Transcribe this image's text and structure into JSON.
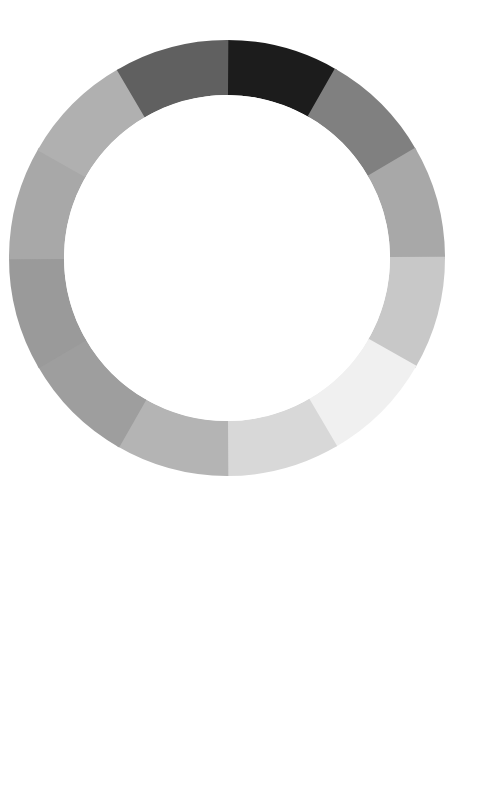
{
  "figure": {
    "background_color": "#ffffff",
    "hole_color": "#ffffff",
    "caption": ""
  },
  "chart_data": {
    "type": "pie",
    "subtitle": "",
    "xlabel": "",
    "ylabel": "",
    "legend_position": "none",
    "grid": false,
    "variant": "donut",
    "center_x": 227,
    "center_y": 258,
    "outer_radius": 218,
    "inner_radius": 163,
    "hole_ratio": 0.75,
    "segment_count": 12,
    "start_angle_deg": -90,
    "direction": "clockwise",
    "equal_slices": true,
    "slice_degrees": 30,
    "categories": [
      "seg-01",
      "seg-02",
      "seg-03",
      "seg-04",
      "seg-05",
      "seg-06",
      "seg-07",
      "seg-08",
      "seg-09",
      "seg-10",
      "seg-11",
      "seg-12"
    ],
    "values": [
      8.333,
      8.333,
      8.333,
      8.333,
      8.333,
      8.333,
      8.333,
      8.333,
      8.333,
      8.333,
      8.333,
      8.333
    ],
    "colors": [
      "#1c1c1c",
      "#808080",
      "#a8a8a8",
      "#c8c8c8",
      "#f0f0f0",
      "#d8d8d8",
      "#b4b4b4",
      "#9e9e9e",
      "#9a9a9a",
      "#a8a8a8",
      "#b0b0b0",
      "#606060"
    ],
    "gray_levels": [
      28,
      128,
      168,
      200,
      240,
      216,
      180,
      158,
      154,
      168,
      176,
      96
    ],
    "slices": [
      {
        "label": "seg-01",
        "start_deg": -90,
        "end_deg": -60,
        "color": "#1c1c1c",
        "gray": 28,
        "value": 8.333
      },
      {
        "label": "seg-02",
        "start_deg": -60,
        "end_deg": -30,
        "color": "#808080",
        "gray": 128,
        "value": 8.333
      },
      {
        "label": "seg-03",
        "start_deg": -30,
        "end_deg": 0,
        "color": "#a8a8a8",
        "gray": 168,
        "value": 8.333
      },
      {
        "label": "seg-04",
        "start_deg": 0,
        "end_deg": 30,
        "color": "#c8c8c8",
        "gray": 200,
        "value": 8.333
      },
      {
        "label": "seg-05",
        "start_deg": 30,
        "end_deg": 60,
        "color": "#f0f0f0",
        "gray": 240,
        "value": 8.333
      },
      {
        "label": "seg-06",
        "start_deg": 60,
        "end_deg": 90,
        "color": "#d8d8d8",
        "gray": 216,
        "value": 8.333
      },
      {
        "label": "seg-07",
        "start_deg": 90,
        "end_deg": 120,
        "color": "#b4b4b4",
        "gray": 180,
        "value": 8.333
      },
      {
        "label": "seg-08",
        "start_deg": 120,
        "end_deg": 150,
        "color": "#9e9e9e",
        "gray": 158,
        "value": 8.333
      },
      {
        "label": "seg-09",
        "start_deg": 150,
        "end_deg": 180,
        "color": "#9a9a9a",
        "gray": 154,
        "value": 8.333
      },
      {
        "label": "seg-10",
        "start_deg": 180,
        "end_deg": 210,
        "color": "#a8a8a8",
        "gray": 168,
        "value": 8.333
      },
      {
        "label": "seg-11",
        "start_deg": 210,
        "end_deg": 240,
        "color": "#b0b0b0",
        "gray": 176,
        "value": 8.333
      },
      {
        "label": "seg-12",
        "start_deg": 240,
        "end_deg": 270,
        "color": "#606060",
        "gray": 96,
        "value": 8.333
      }
    ]
  }
}
